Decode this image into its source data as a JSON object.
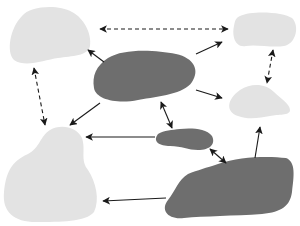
{
  "diagram": {
    "type": "network-of-blobs",
    "background": "#ffffff",
    "colors": {
      "light_node": "#e3e3e3",
      "dark_node": "#6e6e6e",
      "arrow": "#1a1a1a"
    },
    "nodes": [
      {
        "id": "top-left",
        "tone": "light",
        "path": "M22,16 C30,6 58,4 72,12 C84,18 92,34 90,46 C88,56 72,56 58,58 C44,60 26,68 14,60 C6,52 10,28 22,16 Z"
      },
      {
        "id": "top-right",
        "tone": "light",
        "path": "M240,16 C252,10 284,12 292,18 C300,26 296,44 284,46 C272,48 256,44 246,46 C234,48 232,34 234,26 C235,20 236,18 240,16 Z"
      },
      {
        "id": "center",
        "tone": "dark",
        "path": "M108,58 C124,48 156,50 176,54 C194,58 200,70 192,82 C184,94 160,96 138,100 C118,104 96,100 94,88 C92,76 96,66 108,58 Z"
      },
      {
        "id": "right-middle",
        "tone": "light",
        "path": "M240,90 C252,82 266,84 274,92 C280,98 290,104 290,110 C290,116 278,114 270,116 C260,118 248,120 238,116 C226,112 226,100 240,90 Z"
      },
      {
        "id": "small-center",
        "tone": "dark",
        "path": "M158,134 C164,130 172,130 180,129 C190,128 206,128 212,136 C216,144 210,150 198,150 C188,150 182,146 170,146 C160,146 152,142 158,134 Z"
      },
      {
        "id": "bottom-left",
        "tone": "light",
        "path": "M50,130 C60,124 76,126 82,138 C86,150 80,160 88,170 C96,182 100,200 94,212 C86,222 60,222 36,222 C14,222 2,212 4,192 C6,174 10,162 28,154 C40,148 40,136 50,130 Z"
      },
      {
        "id": "bottom-right",
        "tone": "dark",
        "path": "M218,164 C240,156 270,156 286,158 C296,162 294,176 292,192 C290,206 282,212 262,214 C234,216 204,216 184,218 C168,220 160,210 168,200 C176,190 178,180 188,174 C198,170 206,168 218,164 Z"
      }
    ],
    "edges": [
      {
        "id": "tl-tr",
        "from": "top-left",
        "to": "top-right",
        "style": "dashed",
        "direction": "both",
        "x1": 100,
        "y1": 29,
        "x2": 228,
        "y2": 29
      },
      {
        "id": "tl-bl",
        "from": "top-left",
        "to": "bottom-left",
        "style": "dashed",
        "direction": "both",
        "x1": 34,
        "y1": 68,
        "x2": 45,
        "y2": 125
      },
      {
        "id": "tr-rm",
        "from": "top-right",
        "to": "right-middle",
        "style": "dashed",
        "direction": "both",
        "x1": 273,
        "y1": 50,
        "x2": 267,
        "y2": 83
      },
      {
        "id": "c-tl",
        "from": "center",
        "to": "top-left",
        "style": "solid",
        "direction": "forward",
        "x1": 104,
        "y1": 62,
        "x2": 88,
        "y2": 50
      },
      {
        "id": "c-tr",
        "from": "center",
        "to": "top-right",
        "style": "solid",
        "direction": "forward",
        "x1": 196,
        "y1": 54,
        "x2": 222,
        "y2": 42
      },
      {
        "id": "c-rm",
        "from": "center",
        "to": "right-middle",
        "style": "solid",
        "direction": "forward",
        "x1": 196,
        "y1": 90,
        "x2": 222,
        "y2": 98
      },
      {
        "id": "c-bl",
        "from": "center",
        "to": "bottom-left",
        "style": "solid",
        "direction": "forward",
        "x1": 100,
        "y1": 103,
        "x2": 70,
        "y2": 125
      },
      {
        "id": "c-sc",
        "from": "center",
        "to": "small-center",
        "style": "solid",
        "direction": "both",
        "x1": 161,
        "y1": 102,
        "x2": 172,
        "y2": 128
      },
      {
        "id": "sc-bl",
        "from": "small-center",
        "to": "bottom-left",
        "style": "solid",
        "direction": "forward",
        "x1": 155,
        "y1": 137,
        "x2": 86,
        "y2": 137
      },
      {
        "id": "sc-br",
        "from": "small-center",
        "to": "bottom-right",
        "style": "solid",
        "direction": "both",
        "x1": 210,
        "y1": 149,
        "x2": 226,
        "y2": 163
      },
      {
        "id": "br-rm",
        "from": "bottom-right",
        "to": "right-middle",
        "style": "solid",
        "direction": "forward",
        "x1": 255,
        "y1": 158,
        "x2": 260,
        "y2": 127
      },
      {
        "id": "br-bl",
        "from": "bottom-right",
        "to": "bottom-left",
        "style": "solid",
        "direction": "forward",
        "x1": 166,
        "y1": 198,
        "x2": 103,
        "y2": 201
      }
    ]
  }
}
